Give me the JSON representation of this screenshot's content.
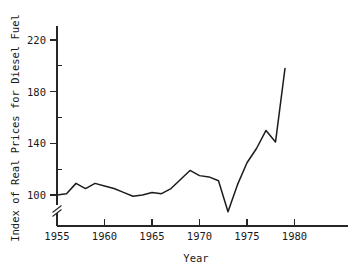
{
  "chart_data": {
    "type": "line",
    "title": "",
    "xlabel": "Year",
    "ylabel": "Index of Real Prices for Diesel Fuel",
    "xlim": [
      1954,
      1983
    ],
    "ylim": [
      85,
      232
    ],
    "y_axis_break": true,
    "y_axis_break_symbol": "//",
    "grid": false,
    "legend": false,
    "x_ticks_major": [
      1955,
      1960,
      1965,
      1970,
      1975,
      1980
    ],
    "x_tick_labels": [
      "1955",
      "1960",
      "1965",
      "1970",
      "1975",
      "1980"
    ],
    "y_ticks_major": [
      100,
      140,
      180,
      220
    ],
    "y_tick_labels": [
      "100",
      "140",
      "180",
      "220"
    ],
    "y_ticks_minor": [
      120,
      160,
      200
    ],
    "x": [
      1955,
      1956,
      1957,
      1958,
      1959,
      1960,
      1961,
      1962,
      1963,
      1964,
      1965,
      1966,
      1967,
      1968,
      1969,
      1970,
      1971,
      1972,
      1973,
      1974,
      1975,
      1976,
      1977,
      1978,
      1979
    ],
    "values": [
      100,
      101,
      109,
      105,
      109,
      107,
      105,
      102,
      99,
      100,
      102,
      101,
      105,
      112,
      119,
      115,
      114,
      111,
      87,
      108,
      125,
      136,
      150,
      141,
      198
    ],
    "series": [
      {
        "name": "Index of Real Prices for Diesel Fuel",
        "color": "#1c1c1c",
        "values": [
          100,
          101,
          109,
          105,
          109,
          107,
          105,
          102,
          99,
          100,
          102,
          101,
          105,
          112,
          119,
          115,
          114,
          111,
          87,
          108,
          125,
          136,
          150,
          141,
          198
        ]
      }
    ]
  },
  "axes": {
    "y_title": "Index of Real Prices for Diesel Fuel",
    "x_title": "Year",
    "y_labels": {
      "l220": "220",
      "l180": "180",
      "l140": "140",
      "l100": "100"
    },
    "x_labels": {
      "x1955": "1955",
      "x1960": "1960",
      "x1965": "1965",
      "x1970": "1970",
      "x1975": "1975",
      "x1980": "1980"
    }
  },
  "colors": {
    "line": "#1c1c1c",
    "axis": "#262626",
    "background": "#ffffff",
    "text": "#1a1a1a"
  }
}
